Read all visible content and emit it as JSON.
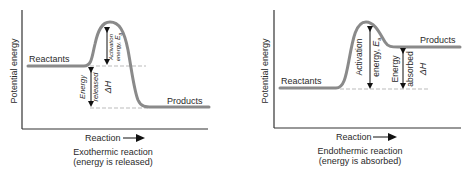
{
  "diagrams": [
    {
      "id": "exothermic",
      "y_axis_label": "Potential energy",
      "x_axis_label": "Reaction",
      "reactants_label": "Reactants",
      "products_label": "Products",
      "activation_label_line1": "Activation",
      "activation_label_line2": "energy, ",
      "activation_symbol": "E",
      "activation_subscript": "a",
      "delta_label_line1": "Energy",
      "delta_label_line2": "released",
      "delta_symbol": "ΔH",
      "caption_line1": "Exothermic reaction",
      "caption_line2": "(energy is released)"
    },
    {
      "id": "endothermic",
      "y_axis_label": "Potential energy",
      "x_axis_label": "Reaction",
      "reactants_label": "Reactants",
      "products_label": "Products",
      "activation_label_line1": "Activation",
      "activation_label_line2": "energy, ",
      "activation_symbol": "E",
      "activation_subscript": "a",
      "delta_label_line1": "Energy",
      "delta_label_line2": "absorbed",
      "delta_symbol": "ΔH",
      "caption_line1": "Endothermic reaction",
      "caption_line2": "(energy is absorbed)"
    }
  ],
  "colors": {
    "curve": "#8a8a8a",
    "axis": "#333333",
    "dashed": "#aaaaaa",
    "arrow": "#111111"
  }
}
